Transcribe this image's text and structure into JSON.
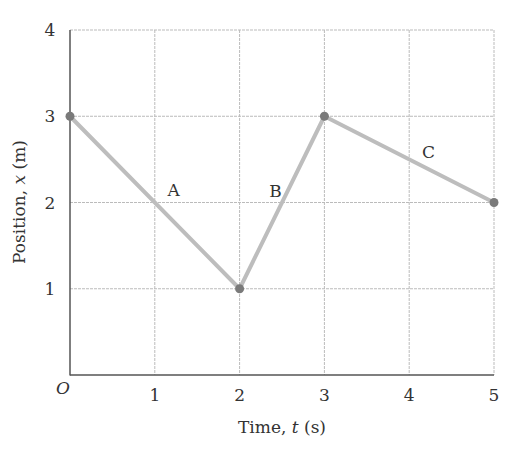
{
  "chart_data": {
    "type": "line",
    "title": "",
    "xlabel": "Time, t (s)",
    "ylabel": "Position, x (m)",
    "xlabel_parts": {
      "pre": "Time, ",
      "var": "t",
      "post": " (s)"
    },
    "ylabel_parts": {
      "pre": "Position, ",
      "var": "x",
      "post": " (m)"
    },
    "origin_label": "O",
    "x_ticks": [
      "1",
      "2",
      "3",
      "4",
      "5"
    ],
    "y_ticks": [
      "1",
      "2",
      "3",
      "4"
    ],
    "xlim": [
      0,
      5
    ],
    "ylim": [
      0,
      4
    ],
    "grid": true,
    "series": [
      {
        "name": "position",
        "x": [
          0,
          2,
          3,
          5
        ],
        "y": [
          3,
          1,
          3,
          2
        ]
      }
    ],
    "segment_labels": [
      {
        "label": "A",
        "x": 1.15,
        "y": 2.15
      },
      {
        "label": "B",
        "x": 2.35,
        "y": 2.13
      },
      {
        "label": "C",
        "x": 4.15,
        "y": 2.58
      }
    ],
    "colors": {
      "line": "#bdbdbd",
      "point": "#7a7a7a",
      "grid": "#bbbbbb",
      "axis": "#555555"
    }
  }
}
